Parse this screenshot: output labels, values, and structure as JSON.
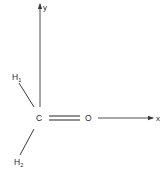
{
  "diagram": {
    "axes": {
      "x_label": "x",
      "y_label": "y"
    },
    "atoms": {
      "carbon": "C",
      "oxygen": "O",
      "h1": {
        "symbol": "H",
        "subscript": "1"
      },
      "h2": {
        "symbol": "H",
        "subscript": "2"
      }
    },
    "bonds": [
      {
        "from": "C",
        "to": "O",
        "type": "double"
      },
      {
        "from": "C",
        "to": "H1",
        "type": "single"
      },
      {
        "from": "C",
        "to": "H2",
        "type": "single"
      }
    ],
    "colors": {
      "line": "#3a3a3a",
      "text": "#2a2a2a"
    }
  }
}
